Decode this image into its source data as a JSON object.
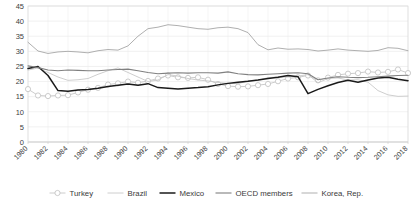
{
  "chart_data": {
    "type": "line",
    "title": "",
    "xlabel": "",
    "ylabel": "",
    "ylim": [
      0,
      45
    ],
    "ytick_step": 5,
    "yticks": [
      "45",
      "40",
      "35",
      "30",
      "25",
      "20",
      "15",
      "10",
      "5",
      "0"
    ],
    "grid": true,
    "legend_position": "bottom",
    "x": [
      1980,
      1981,
      1982,
      1983,
      1984,
      1985,
      1986,
      1987,
      1988,
      1989,
      1990,
      1991,
      1992,
      1993,
      1994,
      1995,
      1996,
      1997,
      1998,
      1999,
      2000,
      2001,
      2002,
      2003,
      2004,
      2005,
      2006,
      2007,
      2008,
      2009,
      2010,
      2011,
      2012,
      2013,
      2014,
      2015,
      2016,
      2017,
      2018
    ],
    "xtick_labels": [
      "1980",
      "1982",
      "1984",
      "1986",
      "1988",
      "1990",
      "1992",
      "1994",
      "1996",
      "1998",
      "2000",
      "2002",
      "2004",
      "2006",
      "2008",
      "2010",
      "2012",
      "2014",
      "2016",
      "2018"
    ],
    "series": [
      {
        "name": "Turkey",
        "color": "#bfbfbf",
        "marker": "circle",
        "line_width": 0.8,
        "values": [
          17.5,
          15.4,
          15.2,
          15.4,
          15.5,
          16.4,
          17.3,
          17.9,
          19.0,
          19.4,
          20.0,
          19.6,
          20.2,
          21.0,
          22.0,
          21.4,
          21.2,
          21.4,
          20.6,
          19.2,
          18.5,
          18.3,
          18.4,
          18.8,
          19.2,
          20.1,
          21.0,
          21.4,
          22.0,
          20.4,
          21.3,
          22.2,
          22.6,
          22.8,
          23.3,
          23.0,
          23.2,
          24.0,
          22.8
        ]
      },
      {
        "name": "Brazil",
        "color": "#c8c8c8",
        "marker": "none",
        "line_width": 0.9,
        "values": [
          23.8,
          24.5,
          23.0,
          21.5,
          20.4,
          20.6,
          21.0,
          22.4,
          23.6,
          24.5,
          23.0,
          21.5,
          20.0,
          20.5,
          22.3,
          21.8,
          21.0,
          20.5,
          20.2,
          19.7,
          19.4,
          19.3,
          20.2,
          20.4,
          21.3,
          21.5,
          21.5,
          21.8,
          22.3,
          19.6,
          21.0,
          21.2,
          20.5,
          20.6,
          19.8,
          17.0,
          15.6,
          15.1,
          15.2
        ]
      },
      {
        "name": "Mexico",
        "color": "#1a1a1a",
        "marker": "none",
        "line_width": 1.5,
        "values": [
          24.3,
          25.0,
          22.0,
          17.0,
          16.8,
          17.2,
          17.4,
          17.8,
          18.4,
          18.8,
          19.2,
          18.8,
          19.3,
          18.0,
          17.8,
          17.5,
          17.8,
          18.0,
          18.3,
          18.9,
          19.4,
          19.8,
          20.1,
          20.5,
          21.0,
          21.4,
          22.0,
          21.6,
          16.0,
          17.4,
          18.6,
          19.7,
          20.4,
          19.8,
          20.5,
          21.2,
          21.4,
          20.8,
          20.3
        ]
      },
      {
        "name": "OECD members",
        "color": "#808080",
        "marker": "none",
        "line_width": 1.1,
        "values": [
          25.2,
          24.6,
          23.8,
          23.6,
          23.8,
          23.7,
          23.6,
          23.6,
          23.8,
          24.0,
          24.1,
          23.6,
          23.0,
          22.6,
          22.8,
          22.9,
          22.8,
          22.9,
          22.9,
          22.8,
          23.2,
          22.6,
          22.3,
          22.2,
          22.4,
          22.6,
          22.8,
          22.9,
          22.6,
          20.6,
          21.2,
          21.6,
          21.4,
          21.3,
          21.4,
          21.6,
          21.8,
          22.0,
          22.1
        ]
      },
      {
        "name": "Korea, Rep.",
        "color": "#a6a6a6",
        "marker": "none",
        "line_width": 0.9,
        "values": [
          33.0,
          30.1,
          29.3,
          29.8,
          30.0,
          29.8,
          29.5,
          30.2,
          30.6,
          30.4,
          31.8,
          35.0,
          37.5,
          38.0,
          38.8,
          38.5,
          38.0,
          37.5,
          37.3,
          37.8,
          38.0,
          37.5,
          36.2,
          32.2,
          30.5,
          31.1,
          30.7,
          30.8,
          30.6,
          30.1,
          30.4,
          30.8,
          30.4,
          30.2,
          30.0,
          30.3,
          31.2,
          31.0,
          30.2
        ]
      }
    ]
  },
  "legend": [
    {
      "label": "Turkey"
    },
    {
      "label": "Brazil"
    },
    {
      "label": "Mexico"
    },
    {
      "label": "OECD members"
    },
    {
      "label": "Korea, Rep."
    }
  ]
}
